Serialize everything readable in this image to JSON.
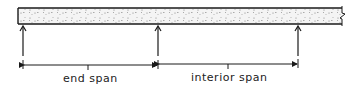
{
  "diagram": {
    "slab": {
      "fill_pattern": "stippled-concrete",
      "continues_right": true
    },
    "supports": [
      {
        "name": "support-1",
        "x": 23
      },
      {
        "name": "support-2",
        "x": 158
      },
      {
        "name": "support-3",
        "x": 298
      }
    ],
    "dimensions": [
      {
        "label": "end span",
        "from_support": 1,
        "to_support": 2
      },
      {
        "label": "interior span",
        "from_support": 2,
        "to_support": 3
      }
    ],
    "colors": {
      "line": "#1a1a1a",
      "fill": "#f4f4f4",
      "stipple": "#555555"
    }
  }
}
